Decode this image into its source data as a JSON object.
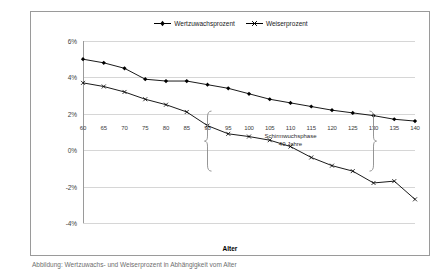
{
  "caption": "Abbildung: Wertzuwachs- und Weiserprozent in Abhängigkeit vom Alter",
  "chart_data": {
    "type": "line",
    "title": "",
    "xlabel": "Alter",
    "ylabel": "",
    "x": [
      60,
      65,
      70,
      75,
      80,
      85,
      90,
      95,
      100,
      105,
      110,
      115,
      120,
      125,
      130,
      135,
      140
    ],
    "xlim": [
      60,
      140
    ],
    "xtick_labels": [
      "60",
      "65",
      "70",
      "75",
      "80",
      "85",
      "90",
      "95",
      "100",
      "105",
      "110",
      "115",
      "120",
      "125",
      "130",
      "135",
      "140"
    ],
    "ylim": [
      -4,
      6
    ],
    "ytick_values": [
      6,
      4,
      2,
      0,
      -2,
      -4
    ],
    "ytick_labels": [
      "6%",
      "4%",
      "2%",
      "0%",
      "-2%",
      "-4%"
    ],
    "grid": true,
    "legend_position": "top-center",
    "series": [
      {
        "name": "Wertzuwachsprozent",
        "marker": "filled-diamond",
        "color": "#000000",
        "values": [
          5.0,
          4.8,
          4.5,
          3.9,
          3.8,
          3.8,
          3.6,
          3.4,
          3.1,
          2.8,
          2.6,
          2.4,
          2.2,
          2.05,
          1.9,
          1.7,
          1.6
        ]
      },
      {
        "name": "Weiserprozent",
        "marker": "cross",
        "color": "#000000",
        "values": [
          3.7,
          3.5,
          3.2,
          2.8,
          2.5,
          2.1,
          1.35,
          0.9,
          0.75,
          0.55,
          0.2,
          -0.4,
          -0.85,
          -1.15,
          -1.8,
          -1.7,
          -2.7
        ]
      }
    ],
    "annotations": [
      {
        "text_line1": "Schirmwuchsphase",
        "text_line2": "40 Jahre",
        "brace_from_x": 90,
        "brace_to_x": 130
      }
    ]
  }
}
